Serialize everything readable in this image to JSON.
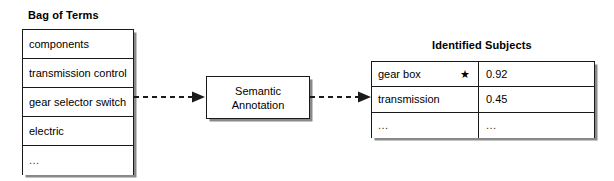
{
  "diagram": {
    "background_color": "#ffffff",
    "line_color": "#1a1a1a"
  },
  "bag_of_terms": {
    "title": "Bag of Terms",
    "items": [
      {
        "label": "components"
      },
      {
        "label": "transmission control"
      },
      {
        "label": "gear selector switch"
      },
      {
        "label": "electric"
      },
      {
        "label": "..."
      }
    ]
  },
  "process": {
    "line1": "Semantic",
    "line2": "Annotation"
  },
  "identified_subjects": {
    "title": "Identified Subjects",
    "rows": [
      {
        "name": "gear box",
        "marker": "★",
        "score": "0.92"
      },
      {
        "name": "transmission",
        "marker": "",
        "score": "0.45"
      },
      {
        "name": "...",
        "marker": "",
        "score": "..."
      }
    ]
  },
  "connectors": [
    {
      "name": "bag-to-annotation",
      "style": "dashed-arrow"
    },
    {
      "name": "annotation-to-subjects",
      "style": "dashed-arrow"
    }
  ]
}
